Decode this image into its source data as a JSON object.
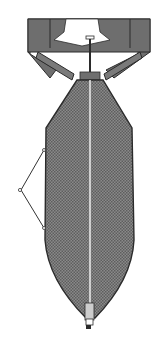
{
  "figure": {
    "subject": "aerial bomb cross-section",
    "components": [
      "tail fin assembly",
      "tail fuze",
      "bomb body",
      "central burster tube",
      "suspension lug strut",
      "nose fuze"
    ]
  },
  "colors": {
    "background": "#ffffff",
    "fin_fill": "#6e6e6e",
    "body_fill": "#7a7a7a",
    "outline": "#2b2b2b",
    "tube": "#e8e8e8"
  }
}
